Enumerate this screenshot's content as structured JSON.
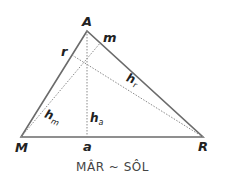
{
  "diagram": {
    "vertices": {
      "A": "A",
      "M": "M",
      "R": "R"
    },
    "feet": {
      "m": "m",
      "r": "r",
      "a": "a"
    },
    "altitudes": [
      {
        "name": "h",
        "sub": "m"
      },
      {
        "name": "h",
        "sub": "a"
      },
      {
        "name": "h",
        "sub": "r"
      }
    ],
    "caption": "MÂR ~ SÔL",
    "colors": {
      "line": "#6b6b6b",
      "dotted": "#8a8a8a",
      "text": "#222222"
    }
  }
}
